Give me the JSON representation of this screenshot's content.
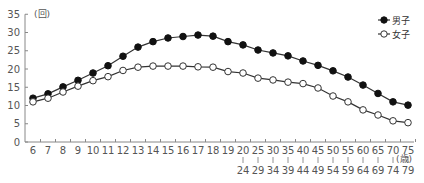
{
  "chart_data": {
    "type": "line",
    "title": "",
    "ylabel": "(回)",
    "xlabel": "(歳)",
    "ylim": [
      0,
      35
    ],
    "yticks": [
      0,
      5,
      10,
      15,
      20,
      25,
      30,
      35
    ],
    "grid": false,
    "legend_position": "top-right",
    "categories": [
      "6",
      "7",
      "8",
      "9",
      "10",
      "11",
      "12",
      "13",
      "14",
      "15",
      "16",
      "17",
      "18",
      "19",
      "20-24",
      "25-29",
      "30-34",
      "35-39",
      "40-44",
      "45-49",
      "50-54",
      "55-59",
      "60-64",
      "65-69",
      "70-74",
      "75-79"
    ],
    "category_labels_top": [
      "6",
      "7",
      "8",
      "9",
      "10",
      "11",
      "12",
      "13",
      "14",
      "15",
      "16",
      "17",
      "18",
      "19",
      "20",
      "25",
      "30",
      "35",
      "40",
      "45",
      "50",
      "55",
      "60",
      "65",
      "70",
      "75"
    ],
    "category_labels_bottom": [
      "",
      "",
      "",
      "",
      "",
      "",
      "",
      "",
      "",
      "",
      "",
      "",
      "",
      "",
      "24",
      "29",
      "34",
      "39",
      "44",
      "49",
      "54",
      "59",
      "64",
      "69",
      "74",
      "79"
    ],
    "series": [
      {
        "name": "男子",
        "marker": "filled-circle",
        "values": [
          12.0,
          13.2,
          15.1,
          16.9,
          18.9,
          20.9,
          23.5,
          26.0,
          27.5,
          28.5,
          28.9,
          29.3,
          29.0,
          27.5,
          26.6,
          25.2,
          24.4,
          23.6,
          22.2,
          21.0,
          19.5,
          17.8,
          15.6,
          13.3,
          11.0,
          10.1
        ]
      },
      {
        "name": "女子",
        "marker": "open-circle",
        "values": [
          11.0,
          12.0,
          13.7,
          15.3,
          16.8,
          17.9,
          19.6,
          20.5,
          20.8,
          20.8,
          20.8,
          20.6,
          20.5,
          19.3,
          18.9,
          17.5,
          17.0,
          16.4,
          16.0,
          14.8,
          12.6,
          11.0,
          8.8,
          7.4,
          5.8,
          5.3
        ]
      }
    ]
  }
}
